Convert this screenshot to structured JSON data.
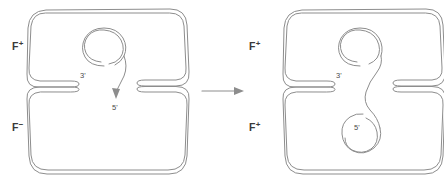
{
  "figure": {
    "stroke_color": "#8d8d8d",
    "text_color": "#3a3a3a",
    "background": "#ffffff"
  },
  "transition": {
    "icon": "right-arrow-icon"
  },
  "panels": [
    {
      "id": "before",
      "donor": {
        "label_base": "F",
        "label_sup": "+",
        "label_full": "F+",
        "role": "donor-cell"
      },
      "recipient": {
        "label_base": "F",
        "label_sup": "−",
        "label_full": "F−",
        "role": "recipient-cell"
      },
      "plasmid": {
        "name": "f-plasmid",
        "three_prime": "3'",
        "five_prime": "5'",
        "state": "rolling-circle-replication-starting"
      }
    },
    {
      "id": "after",
      "donor": {
        "label_base": "F",
        "label_sup": "+",
        "label_full": "F+",
        "role": "donor-cell"
      },
      "recipient": {
        "label_base": "F",
        "label_sup": "+",
        "label_full": "F+",
        "role": "converted-recipient-cell"
      },
      "plasmid": {
        "name": "f-plasmid",
        "three_prime": "3'",
        "five_prime": "5'",
        "state": "strand-transferred-and-recircularized"
      }
    }
  ]
}
